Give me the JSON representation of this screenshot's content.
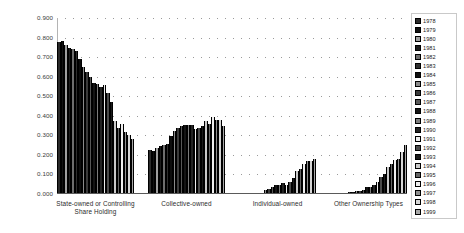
{
  "chart_data": {
    "type": "bar",
    "title": "",
    "xlabel": "",
    "ylabel": "",
    "ylim": [
      0.0,
      0.9
    ],
    "ytick_labels": [
      "0.900",
      "0.800",
      "0.700",
      "0.600",
      "0.500",
      "0.400",
      "0.300",
      "0.200",
      "0.100",
      "0.000"
    ],
    "ytick_values": [
      0.9,
      0.8,
      0.7,
      0.6,
      0.5,
      0.4,
      0.3,
      0.2,
      0.1,
      0.0
    ],
    "grid": true,
    "legend_position": "right",
    "categories": [
      "State-owned or Controlling Share Holding",
      "Collective-owned",
      "Individual-owned",
      "Other Ownership Types"
    ],
    "category_labels_wrapped": [
      [
        "State-owned or Controlling",
        "Share Holding"
      ],
      [
        "Collective-owned"
      ],
      [
        "Individual-owned"
      ],
      [
        "Other Ownership Types"
      ]
    ],
    "legend_entries": [
      "1978",
      "1979",
      "1980",
      "1981",
      "1982",
      "1983",
      "1984",
      "1985",
      "1986",
      "1987",
      "1988",
      "1989",
      "1990",
      "1991",
      "1992",
      "1993",
      "1994",
      "1995",
      "1996",
      "1997",
      "1998",
      "1999"
    ],
    "series": [
      {
        "name": "1978",
        "values": [
          0.775,
          0.225,
          0.0,
          0.0
        ]
      },
      {
        "name": "1979",
        "values": [
          0.785,
          0.22,
          0.0,
          0.0
        ]
      },
      {
        "name": "1980",
        "values": [
          0.76,
          0.235,
          0.001,
          0.004
        ]
      },
      {
        "name": "1981",
        "values": [
          0.745,
          0.248,
          0.002,
          0.005
        ]
      },
      {
        "name": "1982",
        "values": [
          0.74,
          0.252,
          0.003,
          0.006
        ]
      },
      {
        "name": "1983",
        "values": [
          0.73,
          0.255,
          0.004,
          0.008
        ]
      },
      {
        "name": "1984",
        "values": [
          0.69,
          0.296,
          0.007,
          0.012
        ]
      },
      {
        "name": "1985",
        "values": [
          0.648,
          0.322,
          0.018,
          0.014
        ]
      },
      {
        "name": "1986",
        "values": [
          0.625,
          0.337,
          0.025,
          0.016
        ]
      },
      {
        "name": "1987",
        "values": [
          0.598,
          0.347,
          0.036,
          0.02
        ]
      },
      {
        "name": "1988",
        "values": [
          0.567,
          0.354,
          0.045,
          0.035
        ]
      },
      {
        "name": "1989",
        "values": [
          0.565,
          0.354,
          0.048,
          0.035
        ]
      },
      {
        "name": "1990",
        "values": [
          0.546,
          0.354,
          0.054,
          0.047
        ]
      },
      {
        "name": "1991",
        "values": [
          0.56,
          0.33,
          0.048,
          0.062
        ]
      },
      {
        "name": "1992",
        "values": [
          0.515,
          0.338,
          0.059,
          0.088
        ]
      },
      {
        "name": "1993",
        "values": [
          0.47,
          0.348,
          0.08,
          0.103
        ]
      },
      {
        "name": "1994",
        "values": [
          0.372,
          0.372,
          0.118,
          0.139
        ]
      },
      {
        "name": "1995",
        "values": [
          0.34,
          0.36,
          0.128,
          0.155
        ]
      },
      {
        "name": "1996",
        "values": [
          0.36,
          0.392,
          0.152,
          0.172
        ]
      },
      {
        "name": "1997",
        "values": [
          0.318,
          0.377,
          0.168,
          0.18
        ]
      },
      {
        "name": "1998",
        "values": [
          0.302,
          0.378,
          0.17,
          0.217
        ]
      },
      {
        "name": "1999",
        "values": [
          0.282,
          0.346,
          0.177,
          0.249
        ]
      }
    ]
  },
  "legend": {
    "title": ""
  }
}
